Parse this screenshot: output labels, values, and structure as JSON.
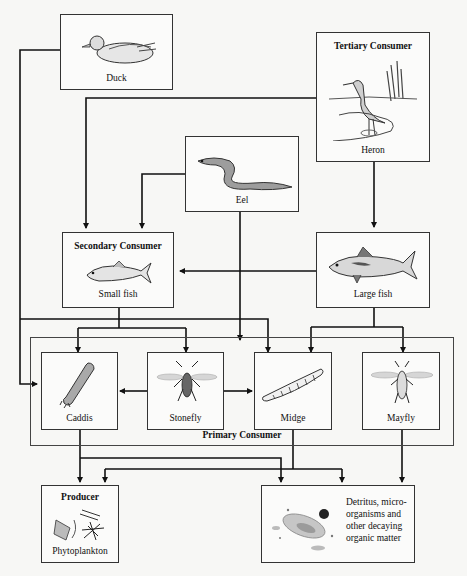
{
  "diagram": {
    "type": "aquatic food web",
    "nodes": {
      "duck": {
        "label": "Duck",
        "icon": "duck-icon"
      },
      "heron": {
        "title": "Tertiary Consumer",
        "label": "Heron",
        "icon": "heron-icon"
      },
      "eel": {
        "label": "Eel",
        "icon": "eel-icon"
      },
      "small_fish": {
        "title": "Secondary Consumer",
        "label": "Small fish",
        "icon": "small-fish-icon"
      },
      "large_fish": {
        "label": "Large fish",
        "icon": "large-fish-icon"
      },
      "caddis": {
        "label": "Caddis",
        "icon": "caddis-icon"
      },
      "stonefly": {
        "label": "Stonefly",
        "icon": "stonefly-icon"
      },
      "midge": {
        "label": "Midge",
        "icon": "midge-icon"
      },
      "mayfly": {
        "label": "Mayfly",
        "icon": "mayfly-icon"
      },
      "phytoplankton": {
        "title": "Producer",
        "label": "Phytoplankton",
        "icon": "phytoplankton-icon"
      },
      "detritus": {
        "label": "Detritus, micro-organisms and other decaying organic matter",
        "lines": [
          "Detritus, micro-",
          "organisms and",
          "other decaying",
          "organic matter"
        ],
        "icon": "detritus-icon"
      }
    },
    "groups": {
      "primary_consumer": {
        "title": "Primary Consumer",
        "members": [
          "caddis",
          "stonefly",
          "midge",
          "mayfly"
        ]
      }
    },
    "edges": [
      {
        "from": "duck",
        "to": "caddis"
      },
      {
        "from": "heron",
        "to": "small_fish"
      },
      {
        "from": "heron",
        "to": "large_fish"
      },
      {
        "from": "eel",
        "to": "small_fish"
      },
      {
        "from": "eel",
        "to": "midge"
      },
      {
        "from": "large_fish",
        "to": "small_fish"
      },
      {
        "from": "small_fish",
        "to": "caddis"
      },
      {
        "from": "small_fish",
        "to": "stonefly"
      },
      {
        "from": "small_fish",
        "to": "midge"
      },
      {
        "from": "large_fish",
        "to": "midge"
      },
      {
        "from": "large_fish",
        "to": "mayfly"
      },
      {
        "from": "stonefly",
        "to": "caddis"
      },
      {
        "from": "stonefly",
        "to": "midge"
      },
      {
        "from": "caddis",
        "to": "phytoplankton"
      },
      {
        "from": "caddis",
        "to": "detritus"
      },
      {
        "from": "midge",
        "to": "phytoplankton"
      },
      {
        "from": "midge",
        "to": "detritus"
      },
      {
        "from": "mayfly",
        "to": "detritus"
      }
    ],
    "colors": {
      "line": "#111111",
      "box_border": "#333333",
      "background": "#f7f7f5"
    }
  }
}
